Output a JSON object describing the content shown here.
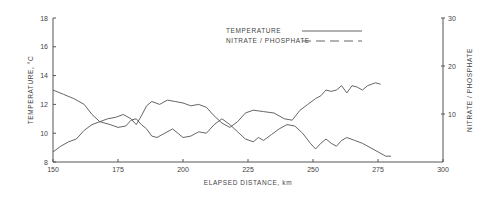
{
  "chart_data": {
    "type": "line",
    "title": "",
    "xlabel": "ELAPSED DISTANCE, km",
    "ylabel": "TEMPERATURE, °C",
    "y2label": "NITRATE / PHOSPHATE",
    "xlim": [
      150,
      300
    ],
    "ylim": [
      8,
      18
    ],
    "y2lim": [
      0,
      30
    ],
    "xticks": [
      150,
      175,
      200,
      225,
      250,
      275,
      300
    ],
    "yticks": [
      8,
      10,
      12,
      14,
      16,
      18
    ],
    "y2ticks": [
      10,
      20,
      30
    ],
    "grid": false,
    "legend_position": "top-center",
    "legend": [
      {
        "name": "TEMPERATURE",
        "style": "solid"
      },
      {
        "name": "NITRATE / PHOSPHATE",
        "style": "dashed"
      }
    ],
    "series": [
      {
        "name": "TEMPERATURE",
        "axis": "left",
        "x": [
          150,
          154,
          158,
          162,
          165,
          168,
          172,
          175,
          178,
          180,
          182,
          184,
          186,
          188,
          190,
          193,
          196,
          198,
          200,
          203,
          206,
          209,
          212,
          215,
          218,
          221,
          224,
          227,
          229,
          231,
          234,
          237,
          240,
          243,
          246,
          249,
          251,
          253,
          255,
          257,
          259,
          261,
          263,
          266,
          269,
          272,
          275,
          278,
          280
        ],
        "values": [
          13.0,
          12.7,
          12.4,
          12.0,
          11.3,
          10.8,
          10.6,
          10.4,
          10.5,
          10.9,
          11.0,
          10.6,
          10.3,
          9.8,
          9.7,
          10.0,
          10.3,
          10.0,
          9.7,
          9.8,
          10.1,
          10.0,
          10.6,
          11.0,
          10.6,
          10.1,
          9.6,
          9.4,
          9.7,
          9.5,
          9.9,
          10.3,
          10.6,
          10.5,
          10.0,
          9.3,
          8.9,
          9.3,
          9.6,
          9.3,
          9.1,
          9.5,
          9.7,
          9.5,
          9.3,
          9.0,
          8.7,
          8.4,
          8.4
        ]
      },
      {
        "name": "NITRATE / PHOSPHATE",
        "axis": "right",
        "x": [
          150,
          153,
          156,
          159,
          162,
          165,
          168,
          171,
          174,
          177,
          180,
          182,
          184,
          186,
          188,
          191,
          194,
          197,
          200,
          203,
          206,
          209,
          212,
          215,
          218,
          221,
          224,
          227,
          231,
          235,
          239,
          242,
          245,
          248,
          251,
          253,
          255,
          257,
          259,
          261,
          263,
          265,
          267,
          269,
          271,
          274,
          276
        ],
        "values": [
          2.1,
          3.3,
          4.2,
          4.8,
          6.6,
          7.8,
          8.4,
          9.0,
          9.3,
          9.9,
          9.0,
          7.8,
          9.6,
          11.7,
          12.6,
          12.0,
          12.9,
          12.6,
          12.3,
          11.7,
          12.0,
          11.4,
          9.6,
          8.1,
          7.2,
          8.4,
          10.2,
          10.8,
          10.5,
          10.2,
          9.0,
          8.7,
          10.8,
          12.0,
          13.2,
          13.8,
          15.0,
          14.7,
          15.0,
          15.9,
          14.4,
          15.9,
          15.6,
          15.0,
          15.9,
          16.5,
          16.2
        ]
      }
    ]
  },
  "labels": {
    "xlabel": "ELAPSED DISTANCE, km",
    "ylabel": "TEMPERATURE, °C",
    "y2label": "NITRATE / PHOSPHATE",
    "legend_temp": "TEMPERATURE",
    "legend_nitrate": "NITRATE / PHOSPHATE"
  }
}
